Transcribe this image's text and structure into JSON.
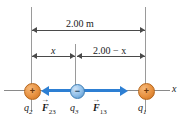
{
  "figure": {
    "type": "physics-force-diagram"
  },
  "dimensions": {
    "total": {
      "label": "2.00 m",
      "from": "q2",
      "to": "q1"
    },
    "left_segment": {
      "label": "x",
      "from": "q2",
      "to": "q3"
    },
    "right_segment": {
      "label": "2.00 − x",
      "from": "q3",
      "to": "q1"
    }
  },
  "charges": [
    {
      "id": "q2",
      "label": "q",
      "subscript": "2",
      "sign": "+",
      "polarity": "positive",
      "color": "#e8913f"
    },
    {
      "id": "q3",
      "label": "q",
      "subscript": "3",
      "sign": "−",
      "polarity": "negative",
      "color": "#8dbde8"
    },
    {
      "id": "q1",
      "label": "q",
      "subscript": "1",
      "sign": "+",
      "polarity": "positive",
      "color": "#e8913f"
    }
  ],
  "forces": [
    {
      "id": "F23",
      "symbol": "F",
      "subscript": "23",
      "direction": "left",
      "color": "#2d7fd3"
    },
    {
      "id": "F13",
      "symbol": "F",
      "subscript": "13",
      "direction": "right",
      "color": "#2d7fd3"
    }
  ],
  "axis": {
    "label": "x",
    "color": "#8a8a8a"
  },
  "colors": {
    "positive_charge": "#e8913f",
    "negative_charge": "#8dbde8",
    "force_vector": "#2d7fd3",
    "guide_line": "#9a9a9a",
    "dimension_line": "#4a4a4a",
    "background": "#ffffff"
  }
}
